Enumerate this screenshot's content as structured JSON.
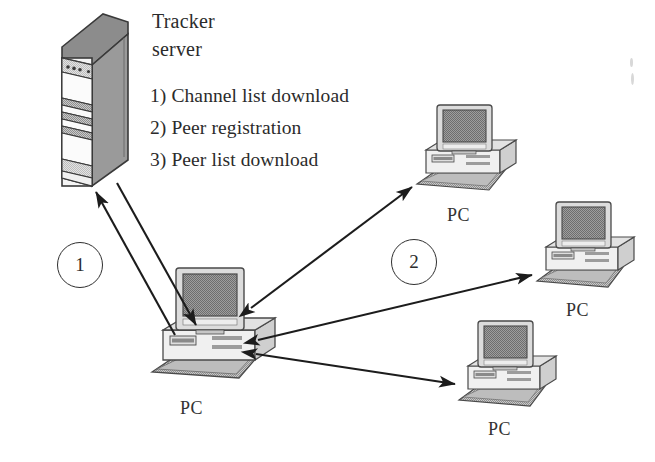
{
  "diagram": {
    "background_color": "#ffffff",
    "ink_color": "#2b2b2b"
  },
  "server": {
    "label_line1": "Tracker",
    "label_line2": "server",
    "icon_name": "tower-server-icon",
    "colors": {
      "top_face": "#8c8c8c",
      "side_face": "#9a9a9a",
      "front_face": "#f2f2f2",
      "outline": "#3a3a3a",
      "band": "#b5b5b5"
    }
  },
  "steps": [
    {
      "index": "1)",
      "text": "Channel list download"
    },
    {
      "index": "2)",
      "text": "Peer registration"
    },
    {
      "index": "3)",
      "text": "Peer list download"
    }
  ],
  "steps_text": {
    "step1": "1) Channel list download",
    "step2": "2) Peer registration",
    "step3": "3) Peer list download"
  },
  "markers": [
    {
      "name": "marker-one",
      "value": "1"
    },
    {
      "name": "marker-two",
      "value": "2"
    }
  ],
  "marker_values": {
    "one": "1",
    "two": "2"
  },
  "computers": [
    {
      "id": "pc-center",
      "label": "PC"
    },
    {
      "id": "pc-top-right",
      "label": "PC"
    },
    {
      "id": "pc-middle-right",
      "label": "PC"
    },
    {
      "id": "pc-bottom-right",
      "label": "PC"
    }
  ],
  "pc_labels": {
    "center": "PC",
    "top_right": "PC",
    "middle_right": "PC",
    "bottom_right": "PC"
  },
  "connections": [
    {
      "name": "server-to-center-down",
      "from": "tracker-server",
      "to": "pc-center",
      "arrow": "single"
    },
    {
      "name": "center-to-server-up",
      "from": "pc-center",
      "to": "tracker-server",
      "arrow": "single"
    },
    {
      "name": "center-to-top-right",
      "from": "pc-center",
      "to": "pc-top-right",
      "arrow": "double"
    },
    {
      "name": "center-to-middle-right",
      "from": "pc-center",
      "to": "pc-middle-right",
      "arrow": "double"
    },
    {
      "name": "center-to-bottom-right",
      "from": "pc-center",
      "to": "pc-bottom-right",
      "arrow": "double"
    }
  ]
}
